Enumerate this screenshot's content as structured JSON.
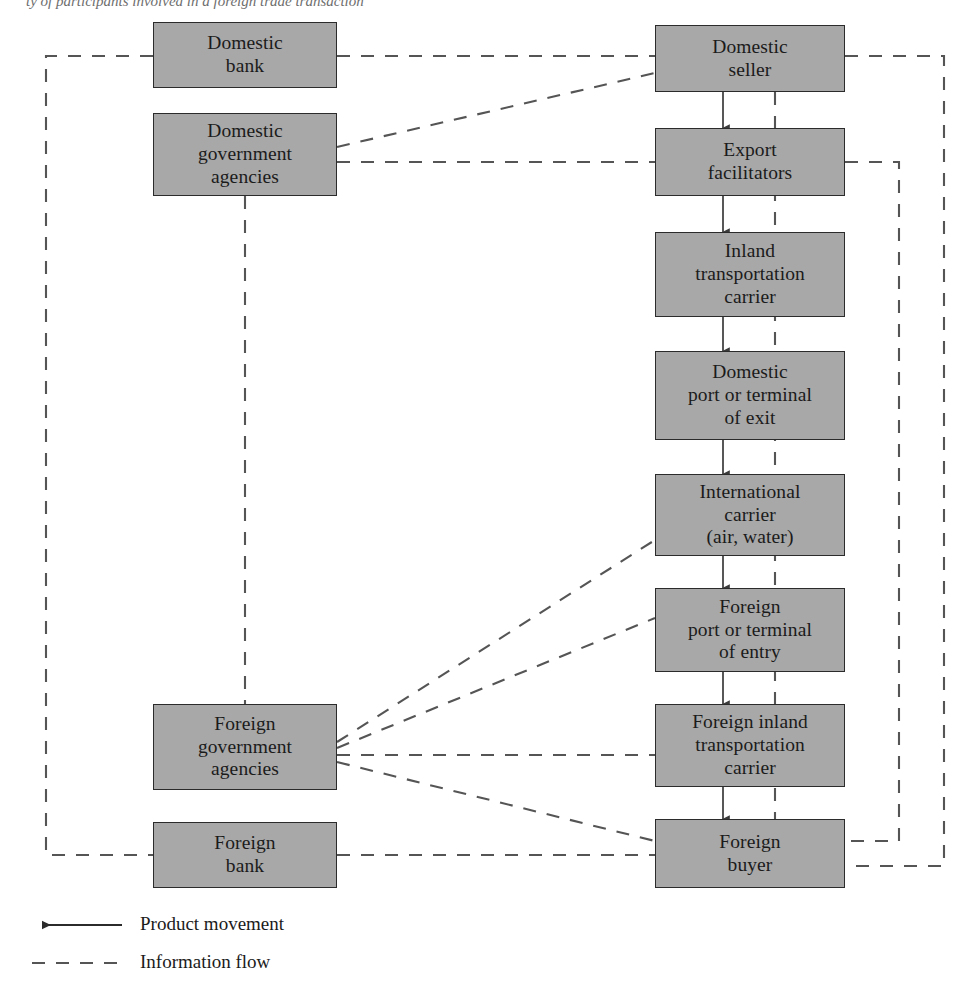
{
  "caption": {
    "text": "ty of participants involved in a foreign trade transaction"
  },
  "diagram": {
    "colors": {
      "node_fill": "#a8a8a8",
      "node_border": "#2b2b2b",
      "line": "#555555",
      "text": "#1b1b1b"
    },
    "left_nodes": [
      {
        "id": "domestic-bank",
        "label": "Domestic\nbank"
      },
      {
        "id": "domestic-government-agencies",
        "label": "Domestic\ngovernment\nagencies"
      },
      {
        "id": "foreign-government-agencies",
        "label": "Foreign\ngovernment\nagencies"
      },
      {
        "id": "foreign-bank",
        "label": "Foreign\nbank"
      }
    ],
    "right_nodes": [
      {
        "id": "domestic-seller",
        "label": "Domestic\nseller"
      },
      {
        "id": "export-facilitators",
        "label": "Export\nfacilitators"
      },
      {
        "id": "inland-transportation-carrier",
        "label": "Inland\ntransportation\ncarrier"
      },
      {
        "id": "domestic-port-or-terminal-of-exit",
        "label": "Domestic\nport or terminal\nof exit"
      },
      {
        "id": "international-carrier",
        "label": "International\ncarrier\n(air, water)"
      },
      {
        "id": "foreign-port-or-terminal-of-entry",
        "label": "Foreign\nport or terminal\nof entry"
      },
      {
        "id": "foreign-inland-transportation-carrier",
        "label": "Foreign inland\ntransportation\ncarrier"
      },
      {
        "id": "foreign-buyer",
        "label": "Foreign\nbuyer"
      }
    ],
    "product_flow_chain": [
      "domestic-seller",
      "export-facilitators",
      "inland-transportation-carrier",
      "domestic-port-or-terminal-of-exit",
      "international-carrier",
      "foreign-port-or-terminal-of-entry",
      "foreign-inland-transportation-carrier",
      "foreign-buyer"
    ],
    "information_links": [
      {
        "from": "domestic-bank",
        "to": "domestic-seller",
        "style": "dashed"
      },
      {
        "from": "domestic-bank",
        "to": "foreign-bank",
        "style": "dashed"
      },
      {
        "from": "domestic-government-agencies",
        "to": "domestic-seller",
        "style": "dashed"
      },
      {
        "from": "domestic-government-agencies",
        "to": "export-facilitators",
        "style": "dashed"
      },
      {
        "from": "domestic-government-agencies",
        "to": "foreign-government-agencies",
        "style": "dashed"
      },
      {
        "from": "foreign-government-agencies",
        "to": "international-carrier",
        "style": "dashed"
      },
      {
        "from": "foreign-government-agencies",
        "to": "foreign-port-or-terminal-of-entry",
        "style": "dashed"
      },
      {
        "from": "foreign-government-agencies",
        "to": "foreign-inland-transportation-carrier",
        "style": "dashed"
      },
      {
        "from": "foreign-government-agencies",
        "to": "foreign-buyer",
        "style": "dashed"
      },
      {
        "from": "foreign-bank",
        "to": "foreign-buyer",
        "style": "dashed"
      },
      {
        "from": "domestic-seller",
        "to": "foreign-buyer",
        "style": "dashed"
      },
      {
        "from": "export-facilitators",
        "to": "foreign-inland-transportation-carrier",
        "style": "dashed"
      },
      {
        "from": "domestic-seller",
        "to": "foreign-buyer",
        "style": "dashed-inner-column"
      }
    ]
  },
  "legend": {
    "items": [
      {
        "id": "product-movement",
        "label": "Product movement",
        "style": "solid-arrow"
      },
      {
        "id": "information-flow",
        "label": "Information flow",
        "style": "dashed"
      }
    ]
  }
}
